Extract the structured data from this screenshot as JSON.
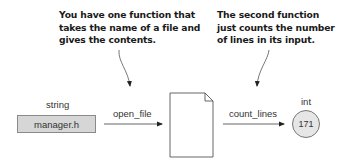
{
  "callouts": [
    {
      "id": "open-file-note",
      "text": "You have one function that\ntakes the name of a file and\ngives the contents."
    },
    {
      "id": "count-lines-note",
      "text": "The second function\njust counts the number\nof lines in its input."
    }
  ],
  "input": {
    "type_label": "string",
    "value": "manager.h"
  },
  "functions": [
    {
      "name": "open_file"
    },
    {
      "name": "count_lines"
    }
  ],
  "intermediate": {
    "kind": "document-icon"
  },
  "output": {
    "type_label": "int",
    "value": "171"
  },
  "colors": {
    "box_fill": "#d6d6d6",
    "box_border": "#8a8a8a",
    "circle_fill": "#e6e6e6",
    "circle_border": "#777777",
    "line": "#555555",
    "text": "#1a1a1a"
  }
}
